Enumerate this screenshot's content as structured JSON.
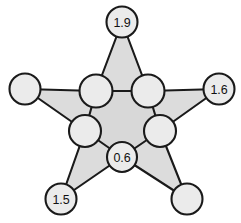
{
  "figure": {
    "name": "star-polygon-graph",
    "width": 241,
    "height": 223,
    "background_color": "#ffffff",
    "star_fill_color": "#dcdcdc",
    "node_fill_color": "#ebebeb",
    "stroke_color": "#1a1a1a"
  },
  "chart_data": {
    "type": "diagram",
    "title": "",
    "node_count": 10,
    "labeled_node_count": 4,
    "nodes": [
      {
        "id": "outer-top",
        "label": "1.9",
        "role": "outer",
        "cx": 122,
        "cy": 22,
        "r": 15.5
      },
      {
        "id": "outer-right",
        "label": "1.6",
        "role": "outer",
        "cx": 219,
        "cy": 89,
        "r": 15.5
      },
      {
        "id": "outer-bottom-right",
        "label": "",
        "role": "outer",
        "cx": 187,
        "cy": 199,
        "r": 15.5
      },
      {
        "id": "outer-bottom-left",
        "label": "1.5",
        "role": "outer",
        "cx": 61,
        "cy": 199,
        "r": 15.5
      },
      {
        "id": "outer-left",
        "label": "",
        "role": "outer",
        "cx": 25,
        "cy": 89,
        "r": 15.5
      },
      {
        "id": "inner-top-left",
        "label": "",
        "role": "inner",
        "cx": 96,
        "cy": 91,
        "r": 16.5
      },
      {
        "id": "inner-top-right",
        "label": "",
        "role": "inner",
        "cx": 148,
        "cy": 91,
        "r": 16.5
      },
      {
        "id": "inner-right",
        "label": "",
        "role": "inner",
        "cx": 160,
        "cy": 131,
        "r": 16.0
      },
      {
        "id": "inner-bottom",
        "label": "0.6",
        "role": "inner",
        "cx": 122,
        "cy": 157,
        "r": 15.0
      },
      {
        "id": "inner-left",
        "label": "",
        "role": "inner",
        "cx": 85,
        "cy": 131,
        "r": 16.0
      }
    ],
    "edges": [
      {
        "from": "outer-top",
        "to": "inner-top-left"
      },
      {
        "from": "outer-top",
        "to": "inner-top-right"
      },
      {
        "from": "outer-right",
        "to": "inner-top-right"
      },
      {
        "from": "outer-right",
        "to": "inner-right"
      },
      {
        "from": "outer-bottom-right",
        "to": "inner-right"
      },
      {
        "from": "outer-bottom-right",
        "to": "inner-bottom"
      },
      {
        "from": "outer-bottom-left",
        "to": "inner-bottom"
      },
      {
        "from": "outer-bottom-left",
        "to": "inner-left"
      },
      {
        "from": "outer-left",
        "to": "inner-left"
      },
      {
        "from": "outer-left",
        "to": "inner-top-left"
      },
      {
        "from": "inner-top-left",
        "to": "inner-top-right"
      },
      {
        "from": "inner-top-right",
        "to": "inner-right"
      },
      {
        "from": "inner-right",
        "to": "inner-bottom"
      },
      {
        "from": "inner-bottom",
        "to": "inner-left"
      },
      {
        "from": "inner-left",
        "to": "inner-top-left"
      }
    ],
    "labels": [
      "1.9",
      "1.6",
      "1.5",
      "0.6"
    ]
  }
}
